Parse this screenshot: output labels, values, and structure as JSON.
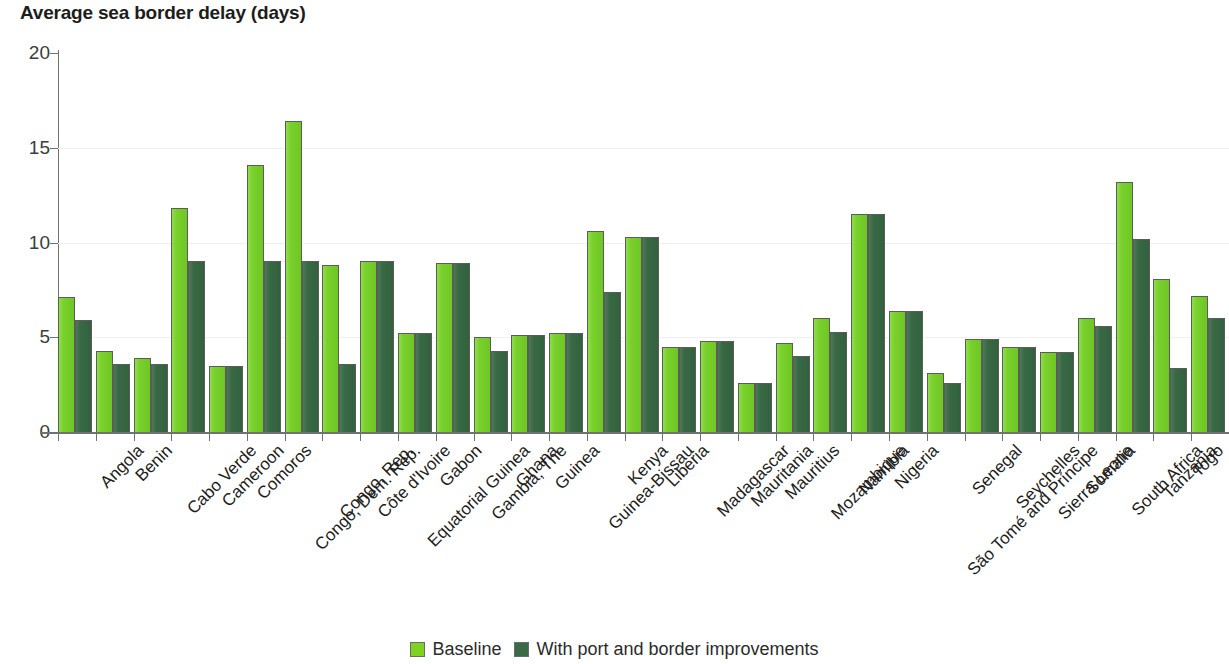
{
  "chart_data": {
    "type": "bar",
    "title": "Average sea border delay (days)",
    "xlabel": "",
    "ylabel": "",
    "ylim": [
      0,
      20
    ],
    "yticks": [
      0,
      5,
      10,
      15,
      20
    ],
    "grid": true,
    "legend_position": "bottom-center",
    "emphasized_category": "Sub-Saharan Africa",
    "categories": [
      "Angola",
      "Benin",
      "Cabo Verde",
      "Cameroon",
      "Comoros",
      "Congo, Dem. Rep.",
      "Congo, Rep.",
      "Côte d'Ivoire",
      "Equatorial Guinea",
      "Gabon",
      "Gambia, The",
      "Ghana",
      "Guinea",
      "Guinea-Bissau",
      "Kenya",
      "Liberia",
      "Madagascar",
      "Mauritania",
      "Mauritius",
      "Mozambique",
      "Namibia",
      "Nigeria",
      "São Tomé and Príncipe",
      "Senegal",
      "Seychelles",
      "Sierra Leone",
      "Somalia",
      "South Africa",
      "Tanzania",
      "Togo",
      "Sub-Saharan Africa"
    ],
    "series": [
      {
        "name": "Baseline",
        "color": "#7ed321",
        "values": [
          7.1,
          4.3,
          3.9,
          11.8,
          3.5,
          14.1,
          16.4,
          8.8,
          9.0,
          5.2,
          8.9,
          5.0,
          5.1,
          5.2,
          10.6,
          10.3,
          4.5,
          4.8,
          2.6,
          4.7,
          6.0,
          11.5,
          6.4,
          3.1,
          4.9,
          4.5,
          4.2,
          6.0,
          13.2,
          8.1,
          7.2
        ]
      },
      {
        "name": "With port and border improvements",
        "color": "#3a6b46",
        "values": [
          5.9,
          3.6,
          3.6,
          9.0,
          3.5,
          9.0,
          9.0,
          3.6,
          9.0,
          5.2,
          8.9,
          4.3,
          5.1,
          5.2,
          7.4,
          10.3,
          4.5,
          4.8,
          2.6,
          4.0,
          5.3,
          11.5,
          6.4,
          2.6,
          4.9,
          4.5,
          4.2,
          5.6,
          10.2,
          3.4,
          6.0
        ]
      }
    ]
  },
  "legend": {
    "entries": [
      {
        "label": "Baseline"
      },
      {
        "label": "With port and border improvements"
      }
    ]
  },
  "colors": {
    "baseline": "#7ed321",
    "improved": "#3a6b46",
    "axis": "#6f7271",
    "grid": "#f0f0ee",
    "text": "#1d1d1b"
  }
}
